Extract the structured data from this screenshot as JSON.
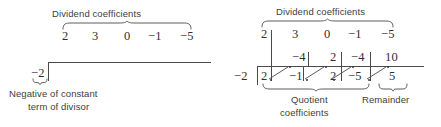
{
  "figure": {
    "title_left": "Dividend coefficients",
    "title_right": "Dividend coefficients"
  },
  "left_panel": {
    "top_label": "Dividend coefficients",
    "dividend": [
      "2",
      "3",
      "0",
      "−1",
      "−5"
    ],
    "divisor": "−2",
    "caption_line1": "Negative of constant",
    "caption_line2": "term of divisor"
  },
  "right_panel": {
    "top_label": "Dividend coefficients",
    "dividend": [
      "2",
      "3",
      "0",
      "−1",
      "−5"
    ],
    "divisor": "−2",
    "middle_row": [
      "−4",
      "2",
      "−4",
      "10"
    ],
    "bottom_row": [
      "2",
      "−1",
      "2",
      "−5",
      "5"
    ],
    "quotient_label_line1": "Quotient",
    "quotient_label_line2": "coefficients",
    "remainder_label": "Remainder"
  },
  "colors": {
    "ink": "#3b3b3b",
    "rule": "#4a4a4a",
    "background": "#ffffff"
  }
}
